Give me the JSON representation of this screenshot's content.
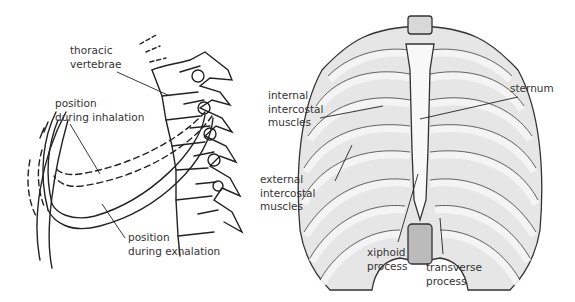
{
  "left_figure": {
    "labels": {
      "thoracic_vertebrae": "thoracic\nvertebrae",
      "position_inhalation": "position\nduring inhalation",
      "position_exhalation": "position\nduring exhalation"
    }
  },
  "right_figure": {
    "labels": {
      "internal_intercostal": "internal\nintercostal\nmuscles",
      "sternum": "sternum",
      "external_intercostal": "external\nintercostal\nmuscles",
      "xiphoid_process": "xiphoid\nprocess",
      "transverse_process": "transverse\nprocess"
    }
  },
  "colors": {
    "line": "#222222",
    "bone": "#f2f2f2",
    "shade": "#9a9a9a",
    "text": "#333333"
  }
}
